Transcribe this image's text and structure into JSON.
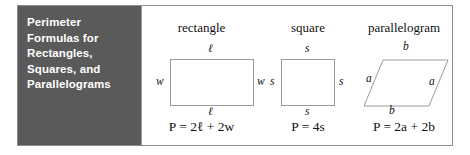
{
  "figure": {
    "title": "Perimeter\nFormulas for\nRectangles,\nSquares, and\nParallelograms",
    "panel_color": "#5a5a5a",
    "title_color": "#ffffff",
    "shapes": [
      {
        "name": "rectangle",
        "labels": {
          "top": "ℓ",
          "bottom": "ℓ",
          "left": "w",
          "right": "w"
        },
        "formula": "P = 2ℓ + 2w"
      },
      {
        "name": "square",
        "labels": {
          "top": "s",
          "bottom": "s",
          "left": "s",
          "right": "s"
        },
        "formula": "P = 4s"
      },
      {
        "name": "parallelogram",
        "labels": {
          "top": "b",
          "bottom": "b",
          "left": "a",
          "right": "a"
        },
        "formula": "P = 2a + 2b"
      }
    ]
  }
}
